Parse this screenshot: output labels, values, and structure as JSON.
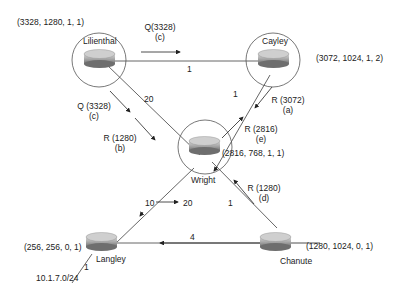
{
  "routers": {
    "lilienthal": {
      "name": "Lilienthal",
      "tuple": "(3328, 1280, 1, 1)"
    },
    "cayley": {
      "name": "Cayley",
      "tuple": "(3072, 1024, 1, 2)"
    },
    "wright": {
      "name": "Wright",
      "tuple": "(2816, 768, 1, 1)"
    },
    "langley": {
      "name": "Langley",
      "tuple": "(256, 256, 0, 1)"
    },
    "chanute": {
      "name": "Chanute",
      "tuple": "(1280, 1024, 0, 1)"
    }
  },
  "links": {
    "lilienthal_cayley": "1",
    "lilienthal_wright": "20",
    "cayley_wright": "1",
    "wright_chanute": "1",
    "langley_chanute": "4",
    "langley_stub": "1"
  },
  "metric_change": {
    "from": "10",
    "to": "20"
  },
  "network": "10.1.7.0/24",
  "messages": {
    "q_top": {
      "msg": "Q(3328)",
      "step": "(c)"
    },
    "q_left": {
      "msg": "Q (3328)",
      "step": "(c)"
    },
    "r_b": {
      "msg": "R (1280)",
      "step": "(b)"
    },
    "r_a": {
      "msg": "R (3072)",
      "step": "(a)"
    },
    "r_e": {
      "msg": "R (2816)",
      "step": "(e)"
    },
    "r_d": {
      "msg": "R (1280)",
      "step": "(d)"
    }
  }
}
